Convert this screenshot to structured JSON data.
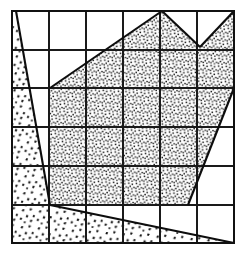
{
  "figure": {
    "kind": "stippled-region-grid-overlay",
    "canvas": {
      "width": 239,
      "height": 254,
      "background": "#ffffff"
    },
    "ink_color": "#111111",
    "grid": {
      "label": "square-counting grid",
      "columns": 6,
      "rows": 6,
      "x_positions": [
        12,
        49,
        86,
        123,
        160,
        197,
        234
      ],
      "y_positions": [
        11,
        50,
        88,
        127,
        166,
        205,
        243
      ],
      "cell_width": 37,
      "cell_height": 38.7,
      "line_color": "#1a1a1a",
      "line_width": 1.05
    },
    "regions": [
      {
        "name": "coarse-stipple-region",
        "pattern": "coarse-triangular-stipple",
        "fill_density": "sparse",
        "mark_size_px": 3.1,
        "outline": [
          [
            12,
            11
          ],
          [
            16,
            11
          ],
          [
            50,
            205
          ],
          [
            234,
            243
          ],
          [
            12,
            243
          ]
        ]
      },
      {
        "name": "fine-stipple-region",
        "pattern": "fine-dot-stipple",
        "fill_density": "dense",
        "mark_size_px": 1.45,
        "outline": [
          [
            50,
            88
          ],
          [
            162,
            11
          ],
          [
            200,
            47
          ],
          [
            234,
            11
          ],
          [
            234,
            88
          ],
          [
            188,
            205
          ],
          [
            50,
            205
          ]
        ]
      }
    ],
    "boundaries": [
      {
        "name": "left-diagonal-edge",
        "from": [
          16,
          11
        ],
        "to": [
          50,
          205
        ]
      },
      {
        "name": "bottom-diagonal-edge",
        "from": [
          50,
          205
        ],
        "to": [
          234,
          243
        ]
      },
      {
        "name": "upper-left-diagonal-edge",
        "from": [
          50,
          88
        ],
        "to": [
          162,
          11
        ]
      },
      {
        "name": "notch-descending-edge",
        "from": [
          162,
          11
        ],
        "to": [
          200,
          47
        ]
      },
      {
        "name": "notch-ascending-edge",
        "from": [
          200,
          47
        ],
        "to": [
          234,
          11
        ]
      },
      {
        "name": "right-diagonal-edge",
        "from": [
          234,
          88
        ],
        "to": [
          188,
          205
        ]
      },
      {
        "name": "region-base-edge",
        "from": [
          188,
          205
        ],
        "to": [
          50,
          205
        ]
      }
    ],
    "vertices": [
      {
        "name": "top-left-corner",
        "x": 12,
        "y": 11
      },
      {
        "name": "peak-vertex",
        "x": 162,
        "y": 11
      },
      {
        "name": "notch-low-vertex",
        "x": 200,
        "y": 47
      },
      {
        "name": "top-right-corner",
        "x": 234,
        "y": 11
      },
      {
        "name": "right-shoulder-vertex",
        "x": 234,
        "y": 88
      },
      {
        "name": "left-junction-vertex",
        "x": 50,
        "y": 205
      },
      {
        "name": "right-base-vertex",
        "x": 188,
        "y": 205
      },
      {
        "name": "bottom-right-corner",
        "x": 234,
        "y": 243
      }
    ]
  }
}
